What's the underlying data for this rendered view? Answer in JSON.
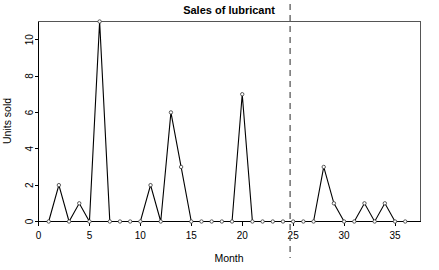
{
  "chart_data": {
    "type": "line",
    "title": "Sales of lubricant",
    "xlabel": "Month",
    "ylabel": "Units sold",
    "x": [
      1,
      2,
      3,
      4,
      5,
      6,
      7,
      8,
      9,
      10,
      11,
      12,
      13,
      14,
      15,
      16,
      17,
      18,
      19,
      20,
      21,
      22,
      23,
      24,
      25,
      26,
      27,
      28,
      29,
      30,
      31,
      32,
      33,
      34,
      35,
      36
    ],
    "values": [
      0,
      2,
      0,
      1,
      0,
      11,
      0,
      0,
      0,
      0,
      2,
      0,
      6,
      3,
      0,
      0,
      0,
      0,
      0,
      7,
      0,
      0,
      0,
      0,
      0,
      0,
      0,
      3,
      1,
      0,
      0,
      1,
      0,
      1,
      0,
      0
    ],
    "series": [
      {
        "name": "Units sold",
        "values": [
          0,
          2,
          0,
          1,
          0,
          11,
          0,
          0,
          0,
          0,
          2,
          0,
          6,
          3,
          0,
          0,
          0,
          0,
          0,
          7,
          0,
          0,
          0,
          0,
          0,
          0,
          0,
          3,
          1,
          0,
          0,
          1,
          0,
          1,
          0,
          0
        ]
      }
    ],
    "xlim": [
      0,
      37.5
    ],
    "ylim": [
      0,
      11
    ],
    "xticks": [
      0,
      5,
      10,
      15,
      20,
      25,
      30,
      35
    ],
    "xtick_labels": [
      "0",
      "5",
      "10",
      "15",
      "20",
      "25",
      "30",
      "35"
    ],
    "yticks": [
      0,
      2,
      4,
      6,
      8,
      10
    ],
    "ytick_labels": [
      "0",
      "2",
      "4",
      "6",
      "8",
      "10"
    ],
    "grid": false,
    "legend": null,
    "marker": "open-circle",
    "line_color": "#000000",
    "annotations": [
      {
        "kind": "vertical-dashed-line",
        "name": "forecast-split-line",
        "x": 24.7,
        "color": "#666666",
        "style": "dashed"
      }
    ]
  }
}
